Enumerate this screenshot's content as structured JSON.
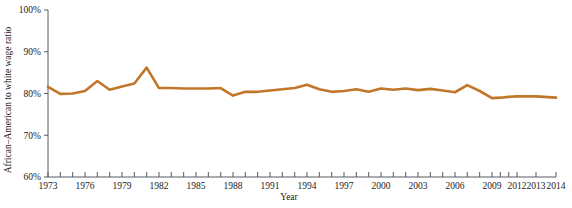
{
  "chart_data": {
    "type": "line",
    "title": "",
    "xlabel": "Year",
    "ylabel": "African–American to white wage ratio",
    "xlim": [
      1973,
      2014
    ],
    "ylim": [
      60,
      100
    ],
    "y_tick_labels": [
      "100%",
      "90%",
      "80%",
      "70%",
      "60%"
    ],
    "y_tick_values": [
      100,
      90,
      80,
      70,
      60
    ],
    "x_tick_labels": [
      "1973",
      "1976",
      "1979",
      "1982",
      "1985",
      "1988",
      "1991",
      "1994",
      "1997",
      "2000",
      "2003",
      "2006",
      "2009",
      "2012",
      "2013",
      "2014"
    ],
    "x_tick_label_values": [
      1973,
      1976,
      1979,
      1982,
      1985,
      1988,
      1991,
      1994,
      1997,
      2000,
      2003,
      2006,
      2009,
      2012,
      2013,
      2014
    ],
    "x_minor_ticks": [
      1973,
      1974,
      1975,
      1976,
      1977,
      1978,
      1979,
      1980,
      1981,
      1982,
      1983,
      1984,
      1985,
      1986,
      1987,
      1988,
      1989,
      1990,
      1991,
      1992,
      1993,
      1994,
      1995,
      1996,
      1997,
      1998,
      1999,
      2000,
      2001,
      2002,
      2003,
      2004,
      2005,
      2006,
      2007,
      2008,
      2009,
      2010,
      2011,
      2012,
      2013,
      2014
    ],
    "grid": false,
    "legend": false,
    "line_color": "#C1762A",
    "line_width": 2.6,
    "series": [
      {
        "name": "African-American to white wage ratio",
        "x": [
          1973,
          1974,
          1975,
          1976,
          1977,
          1978,
          1979,
          1980,
          1981,
          1982,
          1983,
          1984,
          1985,
          1986,
          1987,
          1988,
          1989,
          1990,
          1991,
          1992,
          1993,
          1994,
          1995,
          1996,
          1997,
          1998,
          1999,
          2000,
          2001,
          2002,
          2003,
          2004,
          2005,
          2006,
          2007,
          2008,
          2009,
          2010,
          2011,
          2012,
          2013,
          2014
        ],
        "values": [
          81.6,
          79.9,
          80.0,
          80.6,
          83.0,
          80.9,
          81.7,
          82.4,
          86.2,
          81.3,
          81.3,
          81.2,
          81.2,
          81.2,
          81.3,
          79.5,
          80.4,
          80.4,
          80.7,
          81.0,
          81.3,
          82.1,
          81.0,
          80.4,
          80.6,
          81.0,
          80.4,
          81.2,
          80.9,
          81.2,
          80.8,
          81.1,
          80.7,
          80.3,
          82.0,
          80.6,
          78.9,
          79.0,
          79.2,
          79.3,
          79.3,
          79.0
        ]
      }
    ]
  },
  "layout": {
    "plot_left": 48,
    "plot_right": 556,
    "plot_top": 10,
    "plot_bottom": 177,
    "x_label_positions": [
      48,
      85,
      122,
      159,
      196,
      233,
      270,
      307,
      344,
      381,
      418,
      455,
      492,
      517,
      536,
      556
    ]
  }
}
